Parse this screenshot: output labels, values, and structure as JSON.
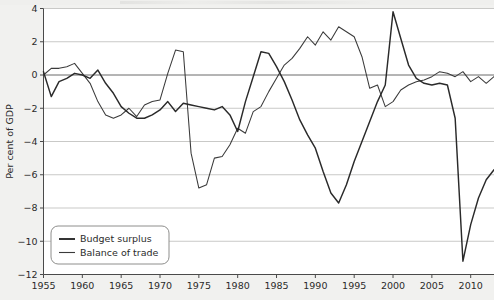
{
  "figure": {
    "background_color": "#f1f1ef",
    "plot_background_color": "#ffffff",
    "grid_color": "#c9c9c7",
    "axis_color": "#4a4a4a"
  },
  "chart_data": {
    "type": "line",
    "title": "",
    "xlabel": "",
    "ylabel": "Per cent of GDP",
    "xlim": [
      1955,
      2013
    ],
    "ylim": [
      -12,
      4
    ],
    "xticks": [
      1955,
      1960,
      1965,
      1970,
      1975,
      1980,
      1985,
      1990,
      1995,
      2000,
      2005,
      2010
    ],
    "xtick_labels": [
      "1955",
      "1960",
      "1965",
      "1970",
      "1975",
      "1980",
      "1985",
      "1990",
      "1995",
      "2000",
      "2005",
      "2010"
    ],
    "yticks": [
      4,
      2,
      0,
      -2,
      -4,
      -6,
      -8,
      -10,
      -12
    ],
    "ytick_labels": [
      "4",
      "2",
      "0",
      "−2",
      "−4",
      "−6",
      "−8",
      "−10",
      "−12"
    ],
    "grid": true,
    "grid_axis": "y",
    "zero_line": true,
    "legend_position": "lower left",
    "legend_entries": [
      "Budget surplus",
      "Balance of trade"
    ],
    "x": [
      1955,
      1956,
      1957,
      1958,
      1959,
      1960,
      1961,
      1962,
      1963,
      1964,
      1965,
      1966,
      1967,
      1968,
      1969,
      1970,
      1971,
      1972,
      1973,
      1974,
      1975,
      1976,
      1977,
      1978,
      1979,
      1980,
      1981,
      1982,
      1983,
      1984,
      1985,
      1986,
      1987,
      1988,
      1989,
      1990,
      1991,
      1992,
      1993,
      1994,
      1995,
      1996,
      1997,
      1998,
      1999,
      2000,
      2001,
      2002,
      2003,
      2004,
      2005,
      2006,
      2007,
      2008,
      2009,
      2010,
      2011,
      2012,
      2013
    ],
    "series": [
      {
        "name": "Budget surplus",
        "color": "#2a2a2a",
        "line_width": 1.45,
        "values": [
          0.2,
          -1.3,
          -0.4,
          -0.2,
          0.1,
          0.0,
          -0.2,
          0.3,
          -0.5,
          -1.1,
          -1.9,
          -2.3,
          -2.6,
          -2.6,
          -2.4,
          -2.1,
          -1.6,
          -2.2,
          -1.7,
          -1.8,
          -1.9,
          -2.0,
          -2.1,
          -1.9,
          -2.4,
          -3.4,
          -1.6,
          -0.1,
          1.4,
          1.3,
          0.5,
          -0.4,
          -1.5,
          -2.7,
          -3.6,
          -4.4,
          -5.8,
          -7.1,
          -7.7,
          -6.6,
          -5.2,
          -4.0,
          -2.8,
          -1.6,
          -0.6,
          3.8,
          2.2,
          0.6,
          -0.2,
          -0.5,
          -0.6,
          -0.5,
          -0.6,
          -2.6,
          -11.2,
          -9.0,
          -7.4,
          -6.3,
          -5.7
        ]
      },
      {
        "name": "Balance of trade",
        "color": "#3a3a3a",
        "line_width": 1.05,
        "values": [
          0.0,
          0.4,
          0.4,
          0.5,
          0.7,
          0.1,
          -0.5,
          -1.6,
          -2.4,
          -2.6,
          -2.4,
          -2.0,
          -2.5,
          -1.8,
          -1.6,
          -1.5,
          0.1,
          1.5,
          1.4,
          -4.7,
          -6.8,
          -6.6,
          -5.0,
          -4.9,
          -4.2,
          -3.2,
          -3.5,
          -2.2,
          -1.9,
          -1.0,
          -0.2,
          0.6,
          1.0,
          1.6,
          2.3,
          1.8,
          2.6,
          2.1,
          2.9,
          2.6,
          2.3,
          1.1,
          -0.8,
          -0.6,
          -1.9,
          -1.6,
          -0.9,
          -0.6,
          -0.4,
          -0.3,
          -0.1,
          0.2,
          0.1,
          -0.1,
          0.2,
          -0.4,
          -0.1,
          -0.5,
          -0.1
        ]
      }
    ]
  },
  "legend": {
    "items": [
      {
        "label": "Budget surplus",
        "swatch": "line-sample-thick"
      },
      {
        "label": "Balance of trade",
        "swatch": "line-sample-thin"
      }
    ]
  }
}
